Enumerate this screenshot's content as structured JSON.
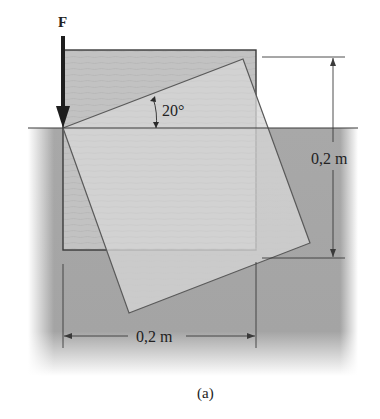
{
  "figure": {
    "force_label": "F",
    "angle_label": "20°",
    "height_dimension_label": "0,2 m",
    "width_dimension_label": "0,2 m",
    "caption": "(a)"
  },
  "colors": {
    "fluid": "#a9a9a9",
    "block_original": "#c4c4c4",
    "block_rotated": "#d3d3d3",
    "outline": "#3a3a3a",
    "force_arrow": "#1e1e1e"
  }
}
